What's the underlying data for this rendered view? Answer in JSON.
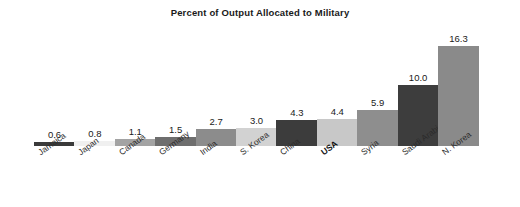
{
  "chart_data": {
    "type": "bar",
    "title": "Percent of Output Allocated to Military",
    "xlabel": "",
    "ylabel": "",
    "ylim": [
      0,
      16.3
    ],
    "grid": false,
    "legend": null,
    "orientation": "vertical",
    "categories": [
      "Jamaica",
      "Japan",
      "Canada",
      "Germany",
      "India",
      "S. Korea",
      "China",
      "USA",
      "Syria",
      "Saudi Arabia",
      "N. Korea"
    ],
    "values": [
      0.6,
      0.8,
      1.1,
      1.5,
      2.7,
      3.0,
      4.3,
      4.4,
      5.9,
      10.0,
      16.3
    ],
    "value_labels": [
      "0.6",
      "0.8",
      "1.1",
      "1.5",
      "2.7",
      "3.0",
      "4.3",
      "4.4",
      "5.9",
      "10.0",
      "16.3"
    ],
    "bar_colors": [
      "#3a3a3a",
      "#f0f0f0",
      "#a3a3a3",
      "#6e6e6e",
      "#8c8c8c",
      "#d2d2d2",
      "#3c3c3c",
      "#c8c8c8",
      "#8e8e8e",
      "#3d3d3d",
      "#8a8a8a"
    ],
    "emphasized_categories": [
      "USA"
    ],
    "background_color": "#ffffff",
    "text_color": "#1a1a1a"
  }
}
